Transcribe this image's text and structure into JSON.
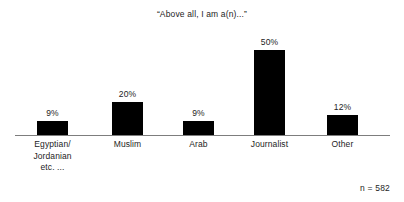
{
  "chart_data": {
    "type": "bar",
    "title": "“Above all, I am a(n)...”",
    "xlabel": "",
    "ylabel": "",
    "categories": [
      "Egyptian/ Jordanian etc. ...",
      "Muslim",
      "Arab",
      "Journalist",
      "Other"
    ],
    "category_lines": [
      [
        "Egyptian/",
        "Jordanian",
        "etc. ..."
      ],
      [
        "Muslim"
      ],
      [
        "Arab"
      ],
      [
        "Journalist"
      ],
      [
        "Other"
      ]
    ],
    "values": [
      9,
      20,
      9,
      50,
      12
    ],
    "value_labels": [
      "9%",
      "20%",
      "9%",
      "50%",
      "12%"
    ],
    "ylim": [
      0,
      50
    ],
    "grid": false,
    "legend": false,
    "annotations": [
      "n = 582"
    ],
    "bar_color": "#000000",
    "axis_color": "#7d7d7d",
    "background_color": "#ffffff",
    "text_color": "#1d1d1d"
  },
  "footnote": {
    "sample_size_label": "n = 582"
  }
}
